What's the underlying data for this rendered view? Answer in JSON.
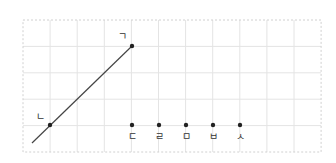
{
  "diagram": {
    "grid": {
      "x0": 23,
      "y0": 20,
      "cols": 11,
      "rows": 5,
      "cell_w": 27.1,
      "cell_h": 26.4,
      "line_color": "#e4e4e4",
      "border_color": "#d0d0d0"
    },
    "line": {
      "from": [
        32,
        143
      ],
      "to": [
        132,
        46
      ],
      "color": "#444444"
    },
    "points": [
      {
        "label": "ㄱ",
        "x": 132,
        "y": 46,
        "lx": 122,
        "ly": 40
      },
      {
        "label": "ㄴ",
        "x": 50,
        "y": 125,
        "lx": 40,
        "ly": 120
      },
      {
        "label": "ㄷ",
        "x": 132,
        "y": 125,
        "lx": 132,
        "ly": 140
      },
      {
        "label": "ㄹ",
        "x": 159,
        "y": 125,
        "lx": 159,
        "ly": 140
      },
      {
        "label": "ㅁ",
        "x": 186,
        "y": 125,
        "lx": 186,
        "ly": 140
      },
      {
        "label": "ㅂ",
        "x": 213,
        "y": 125,
        "lx": 213,
        "ly": 140
      },
      {
        "label": "ㅅ",
        "x": 240,
        "y": 125,
        "lx": 240,
        "ly": 140
      }
    ]
  }
}
